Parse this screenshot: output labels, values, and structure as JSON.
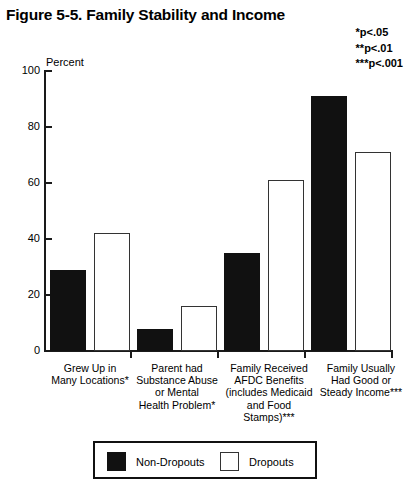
{
  "figure": {
    "title": "Figure 5-5. Family Stability and Income",
    "axis_unit_label": "Percent"
  },
  "significance_notes": [
    "*p<.05",
    "**p<.01",
    "***p<.001"
  ],
  "legend": {
    "items": [
      {
        "label": "Non-Dropouts",
        "style": "filled",
        "color": "#111111"
      },
      {
        "label": "Dropouts",
        "style": "hollow",
        "color": "#ffffff"
      }
    ]
  },
  "y_axis": {
    "ticks": [
      "0",
      "20",
      "40",
      "60",
      "80",
      "100"
    ]
  },
  "categories_display": [
    [
      "Grew Up in",
      "Many Locations*"
    ],
    [
      "Parent had",
      "Substance Abuse",
      "or Mental",
      "Health Problem*"
    ],
    [
      "Family Received",
      "AFDC Benefits",
      "(includes Medicaid",
      "and Food",
      "Stamps)***"
    ],
    [
      "Family Usually",
      "Had Good or",
      "Steady Income***"
    ]
  ],
  "chart_data": {
    "type": "bar",
    "title": "Figure 5-5. Family Stability and Income",
    "xlabel": "",
    "ylabel": "Percent",
    "ylim": [
      0,
      100
    ],
    "yticks": [
      0,
      20,
      40,
      60,
      80,
      100
    ],
    "grid": false,
    "legend_position": "bottom",
    "categories": [
      "Grew Up in Many Locations*",
      "Parent had Substance Abuse or Mental Health Problem*",
      "Family Received AFDC Benefits (includes Medicaid and Food Stamps)***",
      "Family Usually Had Good or Steady Income***"
    ],
    "series": [
      {
        "name": "Non-Dropouts",
        "values": [
          29,
          8,
          35,
          91
        ]
      },
      {
        "name": "Dropouts",
        "values": [
          42,
          16,
          61,
          71
        ]
      }
    ],
    "annotations": [
      "*p<.05",
      "**p<.01",
      "***p<.001"
    ]
  }
}
